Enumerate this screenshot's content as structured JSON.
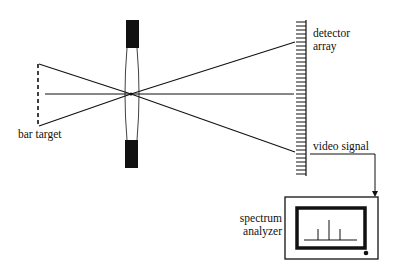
{
  "diagram": {
    "labels": {
      "bar_target": "bar target",
      "detector_line1": "detector",
      "detector_line2": "array",
      "video_signal": "video signal",
      "analyzer_line1": "spectrum",
      "analyzer_line2": "analyzer"
    },
    "components": [
      "bar target",
      "lens",
      "detector array",
      "video signal",
      "spectrum analyzer"
    ],
    "colors": {
      "ink": "#111111",
      "background": "#ffffff"
    }
  }
}
